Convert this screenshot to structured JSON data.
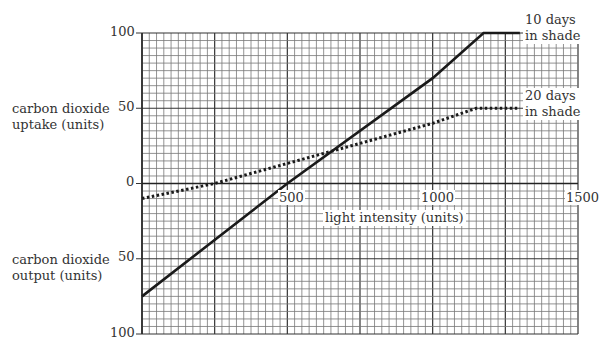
{
  "chart_data": {
    "type": "line",
    "title": "",
    "xlabel": "light intensity (units)",
    "ylabel_top": "carbon dioxide uptake (units)",
    "ylabel_bottom": "carbon dioxide output (units)",
    "xlim": [
      0,
      1500
    ],
    "ylim": [
      -100,
      100
    ],
    "x_ticks": [
      "500",
      "1000",
      "1500"
    ],
    "y_ticks": [
      "100",
      "50",
      "0",
      "50",
      "100"
    ],
    "grid": true,
    "series": [
      {
        "name": "10 days in shade",
        "style": "solid",
        "x": [
          0,
          500,
          1000,
          1175,
          1300
        ],
        "y": [
          -75,
          0,
          70,
          100,
          100
        ]
      },
      {
        "name": "20 days in shade",
        "style": "dotted",
        "x": [
          0,
          250,
          1000,
          1150,
          1300
        ],
        "y": [
          -10,
          0,
          40,
          50,
          50
        ]
      }
    ]
  },
  "labels": {
    "uptake_1": "carbon dioxide",
    "uptake_2": "uptake (units)",
    "output_1": "carbon dioxide",
    "output_2": "output (units)",
    "xlabel": "light intensity (units)",
    "s1_1": "10 days",
    "s1_2": "in shade",
    "s2_1": "20 days",
    "s2_2": "in shade",
    "y100top": "100",
    "y50top": "50",
    "y0": "0",
    "y50bot": "50",
    "y100bot": "100",
    "x500": "500",
    "x1000": "1000",
    "x1500": "1500"
  }
}
